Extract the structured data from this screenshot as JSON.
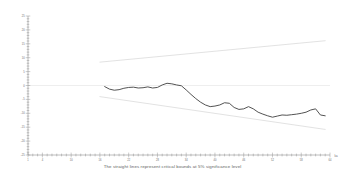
{
  "caption": "The straight lines represent critical bounds at 5% significance level",
  "colors": {
    "background": "#ffffff",
    "cusum_line": "#4a4a4a",
    "bound_line": "#cfcfcf",
    "zero_line": "#e2e2e2",
    "axis": "#8a8a8a",
    "tick_label": "#6a6a6a",
    "caption_text": "#5d5d5d"
  },
  "chart_data": {
    "type": "line",
    "title": "",
    "subtitle": "",
    "xlabel": "ka",
    "ylabel": "",
    "grid": false,
    "legend_position": "none",
    "xlim": [
      1,
      64
    ],
    "ylim": [
      -25,
      25
    ],
    "x_tick_labels": [
      "1",
      "4",
      "10",
      "16",
      "22",
      "28",
      "34",
      "40",
      "46",
      "52",
      "58",
      "64"
    ],
    "x_tick_values": [
      1,
      4,
      10,
      16,
      22,
      28,
      34,
      40,
      46,
      52,
      58,
      64
    ],
    "x_minor_tick_step": 1,
    "y_tick_labels": [
      "25",
      "20",
      "15",
      "10",
      "5",
      "0",
      "-5",
      "-10",
      "-15",
      "-20",
      "-25"
    ],
    "y_tick_values": [
      25,
      20,
      15,
      10,
      5,
      0,
      -5,
      -10,
      -15,
      -20,
      -25
    ],
    "y_minor_tick_step": 1,
    "axis_name_right": "ka",
    "series": [
      {
        "name": "CUSUM of squares statistic",
        "color": "#4a4a4a",
        "style": "solid",
        "x": [
          17,
          18,
          19,
          20,
          21,
          22,
          23,
          24,
          25,
          26,
          27,
          28,
          29,
          30,
          31,
          32,
          33,
          34,
          35,
          36,
          37,
          38,
          39,
          40,
          41,
          42,
          43,
          44,
          45,
          46,
          47,
          48,
          49,
          50,
          51,
          52,
          53,
          54,
          55,
          56,
          57,
          58,
          59,
          60,
          61,
          62,
          63
        ],
        "y": [
          -0.4,
          -1.3,
          -1.7,
          -1.5,
          -1.0,
          -0.7,
          -0.6,
          -0.9,
          -0.8,
          -0.5,
          -0.9,
          -0.7,
          0.2,
          0.8,
          0.6,
          0.2,
          -0.1,
          -1.6,
          -3.2,
          -4.7,
          -6.0,
          -7.0,
          -7.6,
          -7.4,
          -7.0,
          -6.2,
          -6.4,
          -7.9,
          -8.6,
          -8.4,
          -7.6,
          -8.4,
          -9.6,
          -10.3,
          -10.9,
          -11.4,
          -11.0,
          -10.6,
          -10.7,
          -10.5,
          -10.3,
          -10.0,
          -9.6,
          -8.8,
          -8.4,
          -10.6,
          -10.9
        ]
      },
      {
        "name": "Upper critical bound (5%)",
        "color": "#cfcfcf",
        "style": "solid",
        "x": [
          16,
          63
        ],
        "y": [
          8.4,
          16.1
        ]
      },
      {
        "name": "Lower critical bound (5%)",
        "color": "#cfcfcf",
        "style": "solid",
        "x": [
          16,
          63
        ],
        "y": [
          -4.0,
          -15.8
        ]
      },
      {
        "name": "Zero reference line",
        "color": "#e2e2e2",
        "style": "solid",
        "x": [
          1,
          64
        ],
        "y": [
          0,
          0
        ]
      }
    ]
  }
}
